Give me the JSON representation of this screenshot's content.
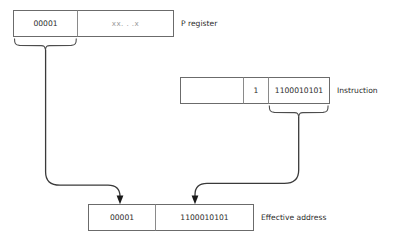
{
  "diagram": {
    "colors": {
      "box_stroke": "#6b6b6b",
      "divider": "#8a8a8a",
      "brace": "#4d4d4d",
      "flow_line": "#3a3a3a",
      "arrowhead": "#1a1a1a",
      "text": "#2b2b2b",
      "faint_text": "#9a9a9a",
      "background": "#ffffff"
    },
    "p_register": {
      "label": "P register",
      "cells": [
        {
          "value": "00001",
          "style": "normal"
        },
        {
          "value": "xx. . .x",
          "style": "faint"
        }
      ]
    },
    "instruction": {
      "label": "Instruction",
      "cells": [
        {
          "value": "",
          "style": "normal"
        },
        {
          "value": "1",
          "style": "normal"
        },
        {
          "value": "1100010101",
          "style": "normal"
        }
      ]
    },
    "effective_address": {
      "label": "Effective address",
      "cells": [
        {
          "value": "00001",
          "style": "normal"
        },
        {
          "value": "1100010101",
          "style": "normal"
        }
      ]
    }
  }
}
